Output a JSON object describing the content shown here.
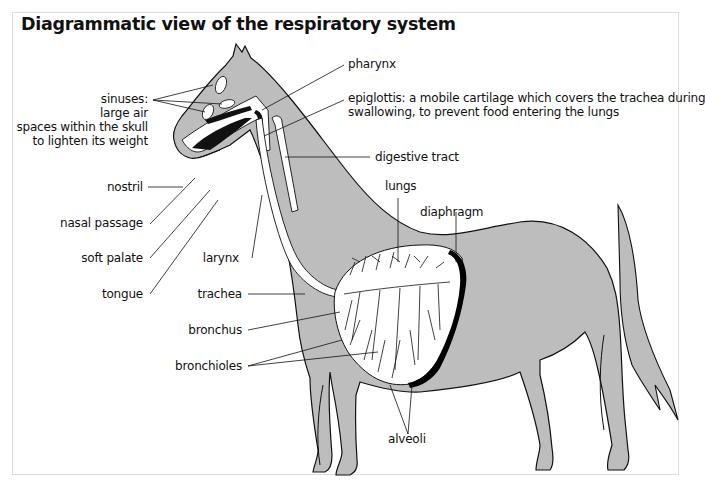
{
  "title": "Diagrammatic view of the respiratory system",
  "colors": {
    "body_fill": "#bdbdbd",
    "outline": "#111111",
    "airway_fill": "#ffffff",
    "diaphragm": "#000000",
    "frame_border": "#dcdcdc"
  },
  "labels": {
    "sinuses": {
      "line1": "sinuses:",
      "line2": "large air",
      "line3": "spaces within the skull",
      "line4": "to lighten its weight"
    },
    "nostril": "nostril",
    "nasal_passage": "nasal passage",
    "soft_palate": "soft palate",
    "tongue": "tongue",
    "larynx": "larynx",
    "trachea": "trachea",
    "bronchus": "bronchus",
    "bronchioles": "bronchioles",
    "pharynx": "pharynx",
    "epiglottis": {
      "line1": "epiglottis: a mobile cartilage which covers the trachea during",
      "line2": "swallowing, to prevent food entering the lungs"
    },
    "digestive_tract": "digestive tract",
    "lungs": "lungs",
    "diaphragm": "diaphragm",
    "alveoli": "alveoli"
  }
}
